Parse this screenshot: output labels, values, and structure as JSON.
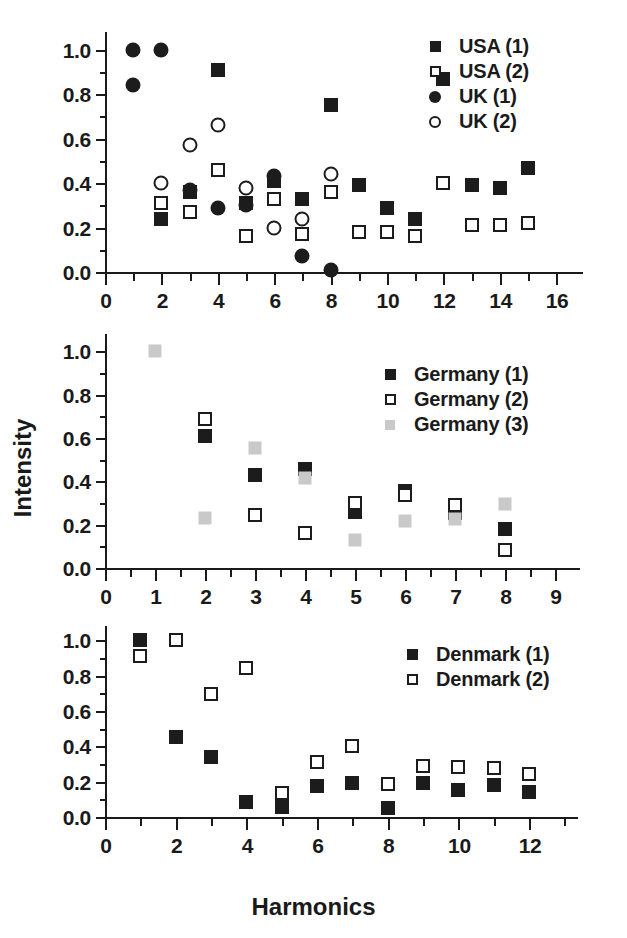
{
  "axes": {
    "ylabel": "Intensity",
    "xlabel": "Harmonics"
  },
  "chart_data": [
    {
      "type": "scatter",
      "title": "",
      "xlabel": "",
      "ylabel": "Intensity",
      "xlim": [
        0,
        16.6
      ],
      "ylim": [
        0.0,
        1.08
      ],
      "xticks": [
        0,
        2,
        4,
        6,
        8,
        10,
        12,
        14,
        16
      ],
      "xtick_labels": [
        "0",
        "2",
        "4",
        "6",
        "8",
        "10",
        "12",
        "14",
        "16"
      ],
      "xminor_step": 1,
      "yticks": [
        0.0,
        0.2,
        0.4,
        0.6,
        0.8,
        1.0
      ],
      "ytick_labels": [
        "0.0",
        "0.2",
        "0.4",
        "0.6",
        "0.8",
        "1.0"
      ],
      "yminor_step": 0.1,
      "grid": false,
      "legend_position": "top-right",
      "series": [
        {
          "name": "USA (1)",
          "marker": "square-filled",
          "color": "#1c1c1c",
          "x": [
            2,
            3,
            4,
            5,
            6,
            7,
            8,
            9,
            10,
            11,
            12,
            13,
            14,
            15
          ],
          "y": [
            0.24,
            0.36,
            0.91,
            0.31,
            0.41,
            0.33,
            0.75,
            0.39,
            0.29,
            0.24,
            0.87,
            0.39,
            0.38,
            0.47
          ]
        },
        {
          "name": "USA (2)",
          "marker": "square-open",
          "color": "#1c1c1c",
          "x": [
            2,
            3,
            4,
            5,
            6,
            7,
            8,
            9,
            10,
            11,
            12,
            13,
            14,
            15
          ],
          "y": [
            0.31,
            0.27,
            0.46,
            0.16,
            0.33,
            0.17,
            0.36,
            0.18,
            0.18,
            0.16,
            0.4,
            0.21,
            0.21,
            0.22
          ]
        },
        {
          "name": "UK (1)",
          "marker": "circle-filled",
          "color": "#1c1c1c",
          "x": [
            1,
            1,
            2,
            3,
            4,
            5,
            6,
            7,
            8
          ],
          "y": [
            1.0,
            0.84,
            1.0,
            0.37,
            0.29,
            0.3,
            0.43,
            0.07,
            0.01
          ]
        },
        {
          "name": "UK (2)",
          "marker": "circle-open",
          "color": "#1c1c1c",
          "x": [
            2,
            3,
            4,
            5,
            6,
            7,
            8
          ],
          "y": [
            0.4,
            0.57,
            0.66,
            0.38,
            0.2,
            0.24,
            0.44
          ]
        }
      ]
    },
    {
      "type": "scatter",
      "title": "",
      "xlabel": "",
      "ylabel": "Intensity",
      "xlim": [
        0,
        9.3
      ],
      "ylim": [
        0.0,
        1.08
      ],
      "xticks": [
        0,
        1,
        2,
        3,
        4,
        5,
        6,
        7,
        8,
        9
      ],
      "xtick_labels": [
        "0",
        "1",
        "2",
        "3",
        "4",
        "5",
        "6",
        "7",
        "8",
        "9"
      ],
      "xminor_step": 0.5,
      "yticks": [
        0.0,
        0.2,
        0.4,
        0.6,
        0.8,
        1.0
      ],
      "ytick_labels": [
        "0.0",
        "0.2",
        "0.4",
        "0.6",
        "0.8",
        "1.0"
      ],
      "yminor_step": 0.1,
      "grid": false,
      "legend_position": "top-right",
      "series": [
        {
          "name": "Germany (1)",
          "marker": "square-filled",
          "color": "#1c1c1c",
          "x": [
            2,
            3,
            4,
            5,
            6,
            7,
            8
          ],
          "y": [
            0.61,
            0.43,
            0.455,
            0.26,
            0.355,
            0.255,
            0.18
          ]
        },
        {
          "name": "Germany (2)",
          "marker": "square-open",
          "color": "#1c1c1c",
          "x": [
            2,
            3,
            4,
            5,
            6,
            7,
            8
          ],
          "y": [
            0.69,
            0.245,
            0.16,
            0.3,
            0.335,
            0.29,
            0.085
          ]
        },
        {
          "name": "Germany (3)",
          "marker": "square-gray",
          "color": "#c9c9c9",
          "x": [
            1,
            2,
            3,
            4,
            5,
            6,
            7,
            8
          ],
          "y": [
            1.0,
            0.23,
            0.555,
            0.415,
            0.13,
            0.215,
            0.225,
            0.295
          ]
        }
      ]
    },
    {
      "type": "scatter",
      "title": "",
      "xlabel": "Harmonics",
      "ylabel": "Intensity",
      "xlim": [
        0,
        13.1
      ],
      "ylim": [
        0.0,
        1.08
      ],
      "xticks": [
        0,
        2,
        4,
        6,
        8,
        10,
        12
      ],
      "xtick_labels": [
        "0",
        "2",
        "4",
        "6",
        "8",
        "10",
        "12"
      ],
      "xminor_step": 1,
      "yticks": [
        0.0,
        0.2,
        0.4,
        0.6,
        0.8,
        1.0
      ],
      "ytick_labels": [
        "0.0",
        "0.2",
        "0.4",
        "0.6",
        "0.8",
        "1.0"
      ],
      "yminor_step": 0.1,
      "grid": false,
      "legend_position": "top-right",
      "series": [
        {
          "name": "Denmark (1)",
          "marker": "square-filled",
          "color": "#1c1c1c",
          "x": [
            1,
            2,
            3,
            4,
            5,
            6,
            7,
            8,
            9,
            10,
            11,
            12
          ],
          "y": [
            1.0,
            0.455,
            0.34,
            0.085,
            0.055,
            0.175,
            0.19,
            0.05,
            0.19,
            0.15,
            0.18,
            0.14
          ]
        },
        {
          "name": "Denmark (2)",
          "marker": "square-open",
          "color": "#1c1c1c",
          "x": [
            1,
            2,
            3,
            4,
            5,
            6,
            7,
            8,
            9,
            10,
            11,
            12
          ],
          "y": [
            0.91,
            1.0,
            0.695,
            0.84,
            0.135,
            0.31,
            0.4,
            0.185,
            0.29,
            0.285,
            0.275,
            0.245
          ]
        }
      ]
    }
  ]
}
